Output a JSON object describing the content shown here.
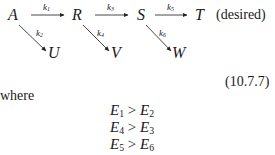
{
  "scheme": {
    "species": {
      "A": "A",
      "R": "R",
      "S": "S",
      "T": "T",
      "U": "U",
      "V": "V",
      "W": "W"
    },
    "rate_constants": {
      "k1": {
        "base": "k",
        "sub": "1"
      },
      "k2": {
        "base": "k",
        "sub": "2"
      },
      "k3": {
        "base": "k",
        "sub": "3"
      },
      "k4": {
        "base": "k",
        "sub": "4"
      },
      "k5": {
        "base": "k",
        "sub": "5"
      },
      "k6": {
        "base": "k",
        "sub": "6"
      }
    },
    "desired_note": "(desired)"
  },
  "equation_number": "(10.7.7)",
  "where_label": "where",
  "inequalities": [
    {
      "left": {
        "base": "E",
        "sub": "1"
      },
      "op": ">",
      "right": {
        "base": "E",
        "sub": "2"
      }
    },
    {
      "left": {
        "base": "E",
        "sub": "4"
      },
      "op": ">",
      "right": {
        "base": "E",
        "sub": "3"
      }
    },
    {
      "left": {
        "base": "E",
        "sub": "5"
      },
      "op": ">",
      "right": {
        "base": "E",
        "sub": "6"
      }
    }
  ]
}
